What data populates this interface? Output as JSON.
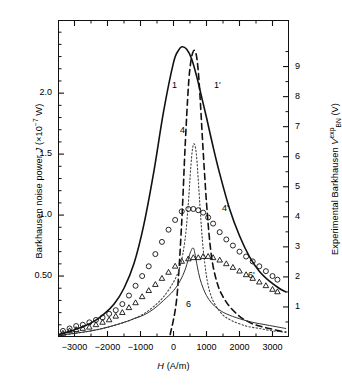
{
  "figure": {
    "xlabel_sym": "H",
    "xlabel_unit": " (A/m)",
    "ylabel_left_a": "Barkhausen noise power ",
    "ylabel_left_sym": "J",
    "ylabel_left_b": " (×10",
    "ylabel_left_exp": "−7",
    "ylabel_left_c": " W)",
    "ylabel_right_a": "Experimental Barkhausen ",
    "ylabel_right_sym": "V",
    "ylabel_right_sup": "exp",
    "ylabel_right_sub": "BN",
    "ylabel_right_b": " (V)"
  },
  "axes": {
    "x_ticks": [
      "−3000",
      "−2000",
      "−1000",
      "0",
      "1000",
      "2000",
      "3000"
    ],
    "x_tick_values": [
      -3000,
      -2000,
      -1000,
      0,
      1000,
      2000,
      3000
    ],
    "y_left_ticks": [
      "0.50",
      "1.0",
      "1.5",
      "2.0"
    ],
    "y_left_tick_values": [
      0.5,
      1.0,
      1.5,
      2.0
    ],
    "y_right_ticks": [
      "1",
      "2",
      "3",
      "4",
      "5",
      "6",
      "7",
      "8",
      "9"
    ],
    "y_right_tick_values": [
      1,
      2,
      3,
      4,
      5,
      6,
      7,
      8,
      9
    ]
  },
  "curve_labels": [
    {
      "text": "1",
      "x": 172,
      "y": 80
    },
    {
      "text": "1'",
      "x": 214,
      "y": 80
    },
    {
      "text": "4",
      "x": 180,
      "y": 125
    },
    {
      "text": "4'",
      "x": 222,
      "y": 203
    },
    {
      "text": "6",
      "x": 186,
      "y": 299
    },
    {
      "text": "6'",
      "x": 248,
      "y": 270
    }
  ],
  "chart_data": {
    "type": "line",
    "title": "",
    "xlabel": "H (A/m)",
    "ylabel": "Barkhausen noise power J (×10⁻⁷ W)",
    "ylabel_secondary": "Experimental Barkhausen V_BN^exp (V)",
    "xlim": [
      -3500,
      3500
    ],
    "ylim": [
      0,
      2.6
    ],
    "ylim_secondary": [
      0,
      10.55
    ],
    "grid": false,
    "legend": "inline-curve-labels",
    "series": [
      {
        "name": "1",
        "style": "solid",
        "width": 1.6,
        "color": "#111111",
        "x": [
          -3500,
          -3200,
          -3000,
          -2700,
          -2400,
          -2100,
          -1800,
          -1500,
          -1200,
          -900,
          -600,
          -300,
          0,
          150,
          250,
          400,
          550,
          700,
          850,
          1000,
          1200,
          1400,
          1700,
          2000,
          2300,
          2600,
          2900,
          3200,
          3400
        ],
        "y": [
          0.02,
          0.04,
          0.06,
          0.09,
          0.13,
          0.19,
          0.27,
          0.4,
          0.6,
          0.92,
          1.35,
          1.85,
          2.25,
          2.35,
          2.38,
          2.36,
          2.28,
          2.14,
          1.97,
          1.8,
          1.56,
          1.34,
          1.05,
          0.83,
          0.66,
          0.54,
          0.46,
          0.4,
          0.37
        ]
      },
      {
        "name": "1'",
        "style": "dashed",
        "width": 1.6,
        "color": "#111111",
        "x": [
          -100,
          100,
          250,
          350,
          450,
          520,
          580,
          640,
          700,
          760,
          820,
          900,
          1000,
          1100,
          1200,
          1350,
          1500,
          1700,
          2000,
          2300,
          2600,
          2900,
          3200,
          3400
        ],
        "y": [
          0.02,
          0.32,
          0.95,
          1.55,
          2.05,
          2.25,
          2.33,
          2.35,
          2.3,
          2.15,
          1.9,
          1.52,
          1.1,
          0.78,
          0.58,
          0.42,
          0.33,
          0.25,
          0.17,
          0.12,
          0.09,
          0.07,
          0.05,
          0.04
        ]
      },
      {
        "name": "4",
        "style": "dotted",
        "width": 1.1,
        "color": "#444444",
        "x": [
          -3500,
          -3000,
          -2500,
          -2000,
          -1500,
          -1200,
          -900,
          -600,
          -300,
          0,
          200,
          350,
          450,
          520,
          580,
          640,
          700,
          760,
          820,
          900,
          1000,
          1100,
          1250,
          1500,
          1800,
          2200,
          2600,
          3000,
          3400
        ],
        "y": [
          0.01,
          0.03,
          0.05,
          0.08,
          0.12,
          0.15,
          0.19,
          0.25,
          0.33,
          0.45,
          0.58,
          0.8,
          1.1,
          1.38,
          1.55,
          1.58,
          1.48,
          1.25,
          1.0,
          0.72,
          0.5,
          0.37,
          0.27,
          0.18,
          0.13,
          0.09,
          0.07,
          0.05,
          0.04
        ]
      },
      {
        "name": "6",
        "style": "solid",
        "width": 1.0,
        "color": "#333333",
        "x": [
          -3500,
          -3000,
          -2500,
          -2000,
          -1500,
          -1200,
          -900,
          -600,
          -300,
          0,
          200,
          350,
          450,
          520,
          580,
          620,
          660,
          720,
          800,
          900,
          1000,
          1150,
          1350,
          1600,
          2000,
          2400,
          2800,
          3200,
          3400
        ],
        "y": [
          0.01,
          0.03,
          0.05,
          0.08,
          0.12,
          0.15,
          0.18,
          0.23,
          0.3,
          0.38,
          0.46,
          0.55,
          0.64,
          0.7,
          0.73,
          0.72,
          0.67,
          0.58,
          0.48,
          0.4,
          0.34,
          0.28,
          0.23,
          0.19,
          0.15,
          0.12,
          0.1,
          0.08,
          0.07
        ]
      },
      {
        "name": "4' (circles)",
        "style": "markers",
        "marker": "circle",
        "color": "#111111",
        "x": [
          -3350,
          -3150,
          -2950,
          -2750,
          -2550,
          -2350,
          -2150,
          -1950,
          -1750,
          -1550,
          -1350,
          -1150,
          -950,
          -750,
          -550,
          -350,
          -150,
          50,
          250,
          450,
          600,
          750,
          900,
          1050,
          1200,
          1400,
          1600,
          1800,
          2000,
          2200,
          2400,
          2600,
          2800,
          3000,
          3150
        ],
        "y": [
          0.05,
          0.07,
          0.09,
          0.1,
          0.12,
          0.14,
          0.16,
          0.19,
          0.22,
          0.27,
          0.34,
          0.42,
          0.5,
          0.58,
          0.68,
          0.78,
          0.88,
          0.96,
          1.03,
          1.05,
          1.05,
          1.04,
          1.02,
          0.98,
          0.93,
          0.86,
          0.8,
          0.75,
          0.7,
          0.66,
          0.62,
          0.58,
          0.54,
          0.5,
          0.47
        ]
      },
      {
        "name": "6' (triangles)",
        "style": "markers",
        "marker": "triangle",
        "color": "#111111",
        "x": [
          -3350,
          -3150,
          -2950,
          -2750,
          -2550,
          -2350,
          -2150,
          -1950,
          -1750,
          -1550,
          -1350,
          -1150,
          -950,
          -750,
          -550,
          -350,
          -150,
          50,
          250,
          450,
          600,
          750,
          900,
          1050,
          1200,
          1400,
          1600,
          1800,
          2000,
          2200,
          2400,
          2600,
          2800,
          3000,
          3150
        ],
        "y": [
          0.03,
          0.05,
          0.06,
          0.07,
          0.08,
          0.1,
          0.12,
          0.14,
          0.17,
          0.2,
          0.24,
          0.28,
          0.33,
          0.38,
          0.43,
          0.48,
          0.53,
          0.58,
          0.62,
          0.64,
          0.65,
          0.65,
          0.66,
          0.66,
          0.65,
          0.63,
          0.6,
          0.57,
          0.54,
          0.51,
          0.48,
          0.45,
          0.42,
          0.39,
          0.37
        ]
      }
    ]
  }
}
